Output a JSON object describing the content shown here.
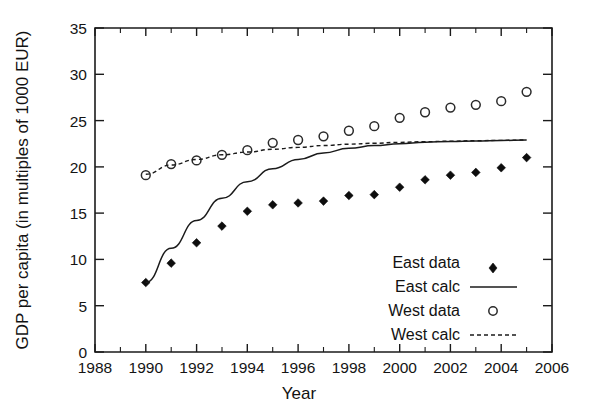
{
  "chart_data": {
    "type": "scatter",
    "title": "",
    "xlabel": "Year",
    "ylabel": "GDP per capita (in multiples of 1000 EUR)",
    "xlim": [
      1988,
      2006
    ],
    "ylim": [
      0,
      35
    ],
    "xticks": [
      1988,
      1990,
      1992,
      1994,
      1996,
      1998,
      2000,
      2002,
      2004,
      2006
    ],
    "yticks": [
      0,
      5,
      10,
      15,
      20,
      25,
      30,
      35
    ],
    "xtick_labels": [
      "1988",
      "1990",
      "1992",
      "1994",
      "1996",
      "1998",
      "2000",
      "2002",
      "2004",
      "2006"
    ],
    "ytick_labels": [
      "0",
      "5",
      "10",
      "15",
      "20",
      "25",
      "30",
      "35"
    ],
    "grid": false,
    "legend_position": "lower right",
    "x": [
      1990,
      1991,
      1992,
      1993,
      1994,
      1995,
      1996,
      1997,
      1998,
      1999,
      2000,
      2001,
      2002,
      2003,
      2004,
      2005
    ],
    "series": [
      {
        "name": "East data",
        "style": "markers",
        "marker": "filled-diamond",
        "values": [
          7.5,
          9.6,
          11.8,
          13.6,
          15.2,
          15.9,
          16.1,
          16.3,
          16.9,
          17.0,
          17.8,
          18.6,
          19.1,
          19.4,
          19.9,
          21.0
        ]
      },
      {
        "name": "East calc",
        "style": "solid-line",
        "marker": "none",
        "values": [
          7.5,
          11.2,
          14.2,
          16.6,
          18.4,
          19.8,
          20.8,
          21.5,
          22.0,
          22.3,
          22.5,
          22.65,
          22.75,
          22.8,
          22.85,
          22.9
        ]
      },
      {
        "name": "West data",
        "style": "markers",
        "marker": "open-circle",
        "values": [
          19.1,
          20.3,
          20.7,
          21.3,
          21.8,
          22.6,
          22.9,
          23.3,
          23.9,
          24.4,
          25.3,
          25.9,
          26.4,
          26.7,
          27.1,
          28.1
        ]
      },
      {
        "name": "West calc",
        "style": "dashed-line",
        "marker": "none",
        "values": [
          19.2,
          20.2,
          20.8,
          21.3,
          21.6,
          21.9,
          22.1,
          22.3,
          22.45,
          22.55,
          22.65,
          22.72,
          22.78,
          22.82,
          22.86,
          22.9
        ]
      }
    ],
    "colors": {
      "east_data": "#0d0d0d",
      "east_calc": "#1b1b1b",
      "west_data": "#2a2a2a",
      "west_calc": "#1b1b1b",
      "axis": "#1b1b1b",
      "background": "#ffffff"
    }
  },
  "legend": {
    "entries": [
      {
        "label": "East data",
        "key": "legend-east-data"
      },
      {
        "label": "East calc",
        "key": "legend-east-calc"
      },
      {
        "label": "West data",
        "key": "legend-west-data"
      },
      {
        "label": "West calc",
        "key": "legend-west-calc"
      }
    ]
  }
}
